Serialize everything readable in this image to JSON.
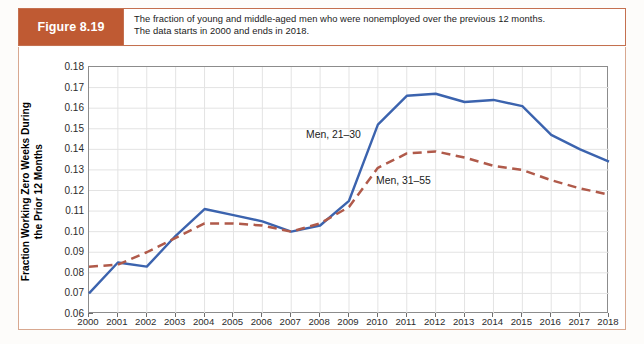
{
  "figure": {
    "tag": "Figure 8.19",
    "caption_line1": "The fraction of young and middle-aged men who were nonemployed over the previous 12 months.",
    "caption_line2": "The data starts in 2000 and ends in 2018."
  },
  "colors": {
    "tag_background": "#bf5a33",
    "caption_border": "#c4704f",
    "plate_border": "#d8a890",
    "axis": "#8c8c8c",
    "grid": "#e3e3e3",
    "series_men_21_30": "#3b63ae",
    "series_men_31_55": "#b05a4a"
  },
  "chart_data": {
    "type": "line",
    "title": "",
    "xlabel": "",
    "ylabel": "Fraction Working Zero Weeks During the Prior 12 Months",
    "ylabel_line1": "Fraction Working Zero Weeks During",
    "ylabel_line2": "the Prior 12 Months",
    "grid": true,
    "legend_position": "inline-annotations",
    "xlim": [
      2000,
      2018
    ],
    "ylim": [
      0.06,
      0.18
    ],
    "ytick_step": 0.01,
    "x": [
      2000,
      2001,
      2002,
      2003,
      2004,
      2005,
      2006,
      2007,
      2008,
      2009,
      2010,
      2011,
      2012,
      2013,
      2014,
      2015,
      2016,
      2017,
      2018
    ],
    "categories": [
      "2000",
      "2001",
      "2002",
      "2003",
      "2004",
      "2005",
      "2006",
      "2007",
      "2008",
      "2009",
      "2010",
      "2011",
      "2012",
      "2013",
      "2014",
      "2015",
      "2016",
      "2017",
      "2018"
    ],
    "ytick_labels": [
      "0.18",
      "0.17",
      "0.16",
      "0.15",
      "0.14",
      "0.13",
      "0.12",
      "0.11",
      "0.10",
      "0.09",
      "0.08",
      "0.07",
      "0.06"
    ],
    "ytick_values": [
      0.18,
      0.17,
      0.16,
      0.15,
      0.14,
      0.13,
      0.12,
      0.11,
      0.1,
      0.09,
      0.08,
      0.07,
      0.06
    ],
    "series": [
      {
        "name": "Men, 21–30",
        "style": "solid",
        "color": "#3b63ae",
        "values": [
          0.07,
          0.085,
          0.083,
          0.098,
          0.111,
          0.108,
          0.105,
          0.1,
          0.103,
          0.115,
          0.152,
          0.166,
          0.167,
          0.163,
          0.164,
          0.161,
          0.147,
          0.14,
          0.134
        ]
      },
      {
        "name": "Men, 31–55",
        "style": "dashed",
        "color": "#b05a4a",
        "values": [
          0.083,
          0.084,
          0.09,
          0.097,
          0.104,
          0.104,
          0.103,
          0.1,
          0.104,
          0.112,
          0.131,
          0.138,
          0.139,
          0.136,
          0.132,
          0.13,
          0.125,
          0.121,
          0.118
        ]
      }
    ],
    "annotations": [
      {
        "text": "Men, 21–30",
        "series": "Men, 21–30"
      },
      {
        "text": "Men, 31–55",
        "series": "Men, 31–55"
      }
    ]
  }
}
